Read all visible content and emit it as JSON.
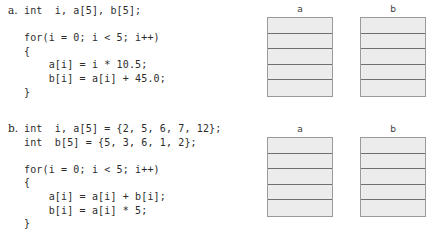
{
  "page": {
    "background_color": "#ffffff",
    "text_color": "#231f20"
  },
  "problems": [
    {
      "label": "a.",
      "code_lines": [
        "int  i, a[5], b[5];",
        "",
        "for(i = 0; i < 5; i++)",
        "{",
        "    a[i] = i * 10.5;",
        "    b[i] = a[i] + 45.0;",
        "}"
      ],
      "code_text": "int  i, a[5], b[5];\n\nfor(i = 0; i < 5; i++)\n{\n    a[i] = i * 10.5;\n    b[i] = a[i] + 45.0;\n}"
    },
    {
      "label": "b.",
      "code_lines": [
        "int  i, a[5] = {2, 5, 6, 7, 12};",
        "int  b[5] = {5, 3, 6, 1, 2};",
        "",
        "for(i = 0; i < 5; i++)",
        "{",
        "    a[i] = a[i] + b[i];",
        "    b[i] = a[i] * 5;",
        "}"
      ],
      "code_text": "int  i, a[5] = {2, 5, 6, 7, 12};\nint  b[5] = {5, 3, 6, 1, 2};\n\nfor(i = 0; i < 5; i++)\n{\n    a[i] = a[i] + b[i];\n    b[i] = a[i] * 5;\n}"
    }
  ],
  "array_diagrams": [
    {
      "group": "top",
      "tables": [
        {
          "title": "a",
          "cells": [
            "",
            "",
            "",
            "",
            ""
          ]
        },
        {
          "title": "b",
          "cells": [
            "",
            "",
            "",
            "",
            ""
          ]
        }
      ]
    },
    {
      "group": "bottom",
      "tables": [
        {
          "title": "a",
          "cells": [
            "",
            "",
            "",
            "",
            ""
          ]
        },
        {
          "title": "b",
          "cells": [
            "",
            "",
            "",
            "",
            ""
          ]
        }
      ]
    }
  ],
  "colors": {
    "cell_fill": "#ececec",
    "cell_border": "#6f6f6f",
    "box_border": "#9a9a9a"
  }
}
